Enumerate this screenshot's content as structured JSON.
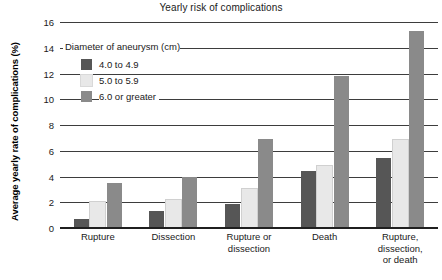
{
  "chart_data": {
    "type": "bar",
    "title": "Yearly risk of complications",
    "xlabel": "",
    "ylabel": "Average yearly rate of complications (%)",
    "ylim": [
      0,
      16
    ],
    "ytick_step": 2,
    "yticks": [
      0,
      2,
      4,
      6,
      8,
      10,
      12,
      14,
      16
    ],
    "ytick_labels": [
      "0",
      "2",
      "4",
      "6",
      "8",
      "10",
      "12",
      "14",
      "16"
    ],
    "grid": "horizontal",
    "legend_position": "upper-left-inside",
    "legend_title": "Diameter of aneurysm (cm)",
    "categories": [
      "Rupture",
      "Dissection",
      "Rupture or\ndissection",
      "Death",
      "Rupture,\ndissection,\nor death"
    ],
    "category_lines": [
      [
        "Rupture"
      ],
      [
        "Dissection"
      ],
      [
        "Rupture or",
        "dissection"
      ],
      [
        "Death"
      ],
      [
        "Rupture,",
        "dissection,",
        "or death"
      ]
    ],
    "series": [
      {
        "name": "4.0 to 4.9",
        "color": "#565656",
        "values": [
          0.7,
          1.3,
          1.9,
          4.4,
          5.4
        ]
      },
      {
        "name": "5.0 to 5.9",
        "color": "#e8e8e8",
        "values": [
          2.0,
          2.2,
          3.0,
          4.8,
          6.8
        ]
      },
      {
        "name": "6.0 or greater",
        "color": "#8a8a8a",
        "values": [
          3.5,
          4.0,
          6.9,
          11.8,
          15.3
        ]
      }
    ]
  }
}
